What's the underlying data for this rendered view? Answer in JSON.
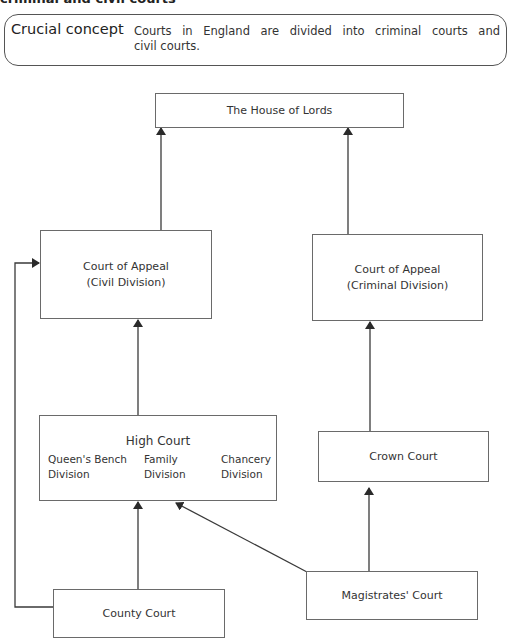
{
  "heading": "criminal and civil courts",
  "concept": {
    "label": "Crucial concept",
    "text_line1": "Courts in England are divided into criminal courts and",
    "text_line2": "civil courts."
  },
  "diagram": {
    "house_of_lords": "The House of Lords",
    "court_of_appeal_civil": {
      "line1": "Court of Appeal",
      "line2": "(Civil Division)"
    },
    "court_of_appeal_criminal": {
      "line1": "Court of Appeal",
      "line2": "(Criminal Division)"
    },
    "high_court": {
      "title": "High Court",
      "divisions": [
        {
          "line1": "Queen's Bench",
          "line2": "Division"
        },
        {
          "line1": "Family",
          "line2": "Division"
        },
        {
          "line1": "Chancery",
          "line2": "Division"
        }
      ]
    },
    "crown_court": "Crown Court",
    "county_court": "County Court",
    "magistrates_court": "Magistrates' Court",
    "line_color": "#3a3a3a"
  }
}
